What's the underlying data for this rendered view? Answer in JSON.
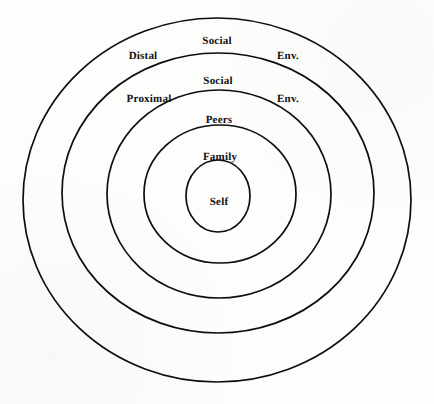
{
  "figure": {
    "kind": "concentric-circles-diagram",
    "background_color": "#fdfdfc",
    "stroke_color": "#0d0d0d"
  },
  "rings": [
    {
      "name": "distal-social-environment",
      "index": 1,
      "cx": 217,
      "cy": 200,
      "rx": 194,
      "ry": 182,
      "stroke_width": 1.7
    },
    {
      "name": "proximal-social-environment",
      "index": 2,
      "cx": 218,
      "cy": 193,
      "rx": 156,
      "ry": 140,
      "stroke_width": 1.7
    },
    {
      "name": "peers",
      "index": 3,
      "cx": 219,
      "cy": 194,
      "rx": 112,
      "ry": 104,
      "stroke_width": 1.7
    },
    {
      "name": "family",
      "index": 4,
      "cx": 220,
      "cy": 194,
      "rx": 76,
      "ry": 69,
      "stroke_width": 1.7
    },
    {
      "name": "self",
      "index": 5,
      "cx": 218,
      "cy": 196,
      "rx": 32,
      "ry": 36,
      "stroke_width": 1.7
    }
  ],
  "labels": [
    {
      "name": "label-social-distal",
      "text": "Social",
      "x": 217,
      "y": 41,
      "size": "11"
    },
    {
      "name": "label-distal",
      "text": "Distal",
      "x": 143,
      "y": 56,
      "size": "11"
    },
    {
      "name": "label-env-distal",
      "text": "Env.",
      "x": 288,
      "y": 56,
      "size": "11"
    },
    {
      "name": "label-social-proximal",
      "text": "Social",
      "x": 218,
      "y": 81,
      "size": "11"
    },
    {
      "name": "label-proximal",
      "text": "Proximal",
      "x": 149,
      "y": 99,
      "size": "11"
    },
    {
      "name": "label-env-proximal",
      "text": "Env.",
      "x": 288,
      "y": 99,
      "size": "11"
    },
    {
      "name": "label-peers",
      "text": "Peers",
      "x": 219,
      "y": 120,
      "size": "11"
    },
    {
      "name": "label-family",
      "text": "Family",
      "x": 220,
      "y": 157,
      "size": "11"
    },
    {
      "name": "label-self",
      "text": "Self",
      "x": 219,
      "y": 202,
      "size": "11"
    }
  ]
}
